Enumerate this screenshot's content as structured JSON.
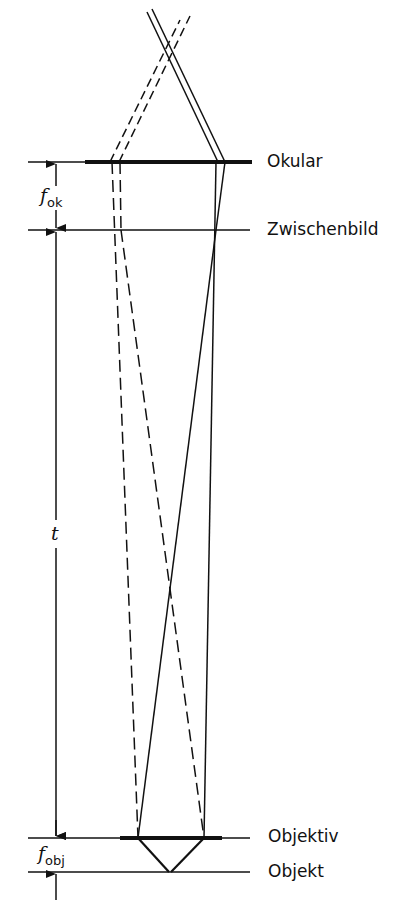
{
  "diagram": {
    "planes": [
      {
        "id": "okular",
        "label": "Okular",
        "y": 162
      },
      {
        "id": "zwischenbild",
        "label": "Zwischenbild",
        "y": 230
      },
      {
        "id": "objektiv",
        "label": "Objektiv",
        "y": 838
      },
      {
        "id": "objekt",
        "label": "Objekt",
        "y": 872
      }
    ],
    "dimensions": {
      "f_ok": {
        "symbol": "f",
        "subscript": "ok"
      },
      "t": {
        "symbol": "t"
      },
      "f_obj": {
        "symbol": "f",
        "subscript": "obj"
      }
    },
    "colors": {
      "line": "#111111",
      "background": "#ffffff"
    }
  }
}
